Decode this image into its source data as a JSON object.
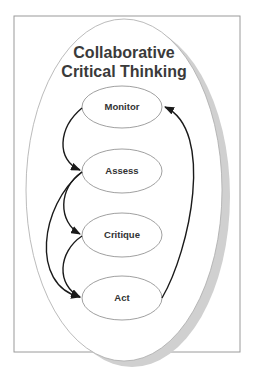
{
  "diagram": {
    "title_line1": "Collaborative",
    "title_line2": "Critical Thinking",
    "nodes": [
      {
        "id": "monitor",
        "label": "Monitor"
      },
      {
        "id": "assess",
        "label": "Assess"
      },
      {
        "id": "critique",
        "label": "Critique"
      },
      {
        "id": "act",
        "label": "Act"
      }
    ],
    "edges": [
      {
        "from": "monitor",
        "to": "assess"
      },
      {
        "from": "assess",
        "to": "critique"
      },
      {
        "from": "assess",
        "to": "act"
      },
      {
        "from": "critique",
        "to": "act"
      },
      {
        "from": "act",
        "to": "monitor"
      }
    ],
    "colors": {
      "frame": "#9a9a9a",
      "outer_ellipse_stroke": "#aaaaaa",
      "shadow": "#d0d0d0",
      "node_stroke": "#888888",
      "arrow": "#1a1a1a",
      "title": "#3a3a3a"
    }
  }
}
